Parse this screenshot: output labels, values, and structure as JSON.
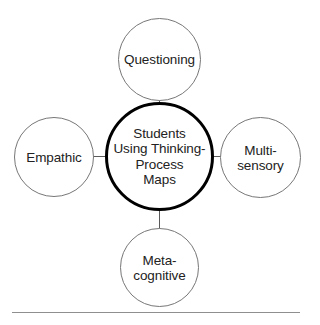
{
  "diagram": {
    "type": "hub-and-spoke",
    "center": {
      "id": "center-node",
      "label": "Students\nUsing Thinking-\nProcess\nMaps",
      "border_color": "#000000",
      "fill_color": "#ffffff"
    },
    "satellites": [
      {
        "id": "questioning",
        "position": "top",
        "label": "Questioning",
        "border_color": "#777777",
        "fill_color": "#ffffff"
      },
      {
        "id": "multi-sensory",
        "position": "right",
        "label": "Multi-\nsensory",
        "border_color": "#777777",
        "fill_color": "#ffffff"
      },
      {
        "id": "meta-cognitive",
        "position": "bottom",
        "label": "Meta-\ncognitive",
        "border_color": "#777777",
        "fill_color": "#ffffff"
      },
      {
        "id": "empathic",
        "position": "left",
        "label": "Empathic",
        "border_color": "#777777",
        "fill_color": "#ffffff"
      }
    ],
    "connectors": {
      "color": "#5a5a5a",
      "count": 4
    },
    "rule": {
      "color": "#8f8f8f"
    },
    "background_color": "#ffffff"
  }
}
